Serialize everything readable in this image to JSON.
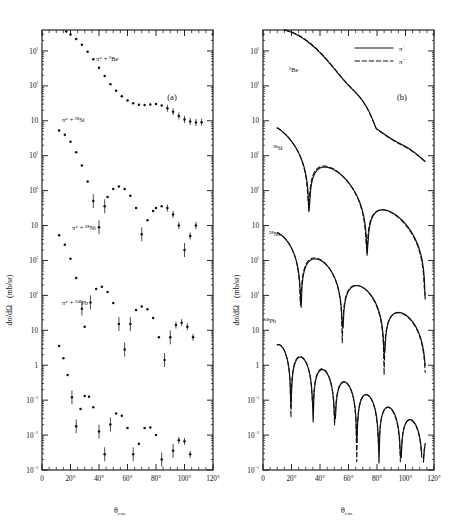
{
  "figure": {
    "caption_panel_a": "(a)",
    "caption_panel_b": "(b)",
    "yaxis_title_main": "dσ/dΩ",
    "yaxis_title_units": "(mb/sr)",
    "xaxis_title": "θ",
    "xaxis_title_sub": "c.m."
  },
  "axes": {
    "x_ticks": [
      "0",
      "20°",
      "40°",
      "60°",
      "80°",
      "100°",
      "120°"
    ],
    "x_values": [
      0,
      20,
      40,
      60,
      80,
      100,
      120
    ],
    "x_range": [
      0,
      120
    ],
    "y_decade_labels": [
      "10³",
      "10²",
      "10",
      "10³",
      "10²",
      "10",
      "10³",
      "10²",
      "10",
      "1",
      "10⁻¹",
      "10⁻²",
      "10⁻³"
    ],
    "y_decade_exponents": [
      11,
      10,
      9,
      8,
      7,
      6,
      5,
      4,
      3,
      2,
      1,
      0,
      -1
    ],
    "y_range_exponents": [
      -1,
      11.6
    ],
    "scale": "log"
  },
  "legend": {
    "position": "top-right-panel-b",
    "entries": [
      {
        "style": "solid",
        "label": "π",
        "charge": "+"
      },
      {
        "style": "dashed",
        "label": "π",
        "charge": "−"
      }
    ]
  },
  "targets": [
    {
      "id": "be",
      "mass": "9",
      "symbol": "Be",
      "label_a": "π⁺ + ⁹Be",
      "label_b": "⁹Be"
    },
    {
      "id": "si",
      "mass": "28",
      "symbol": "Si",
      "label_a": "π⁺ + ²⁸Si",
      "label_b": "²⁸Si"
    },
    {
      "id": "ni",
      "mass": "58",
      "symbol": "Ni",
      "label_a": "π⁺ + ⁵⁸Ni",
      "label_b": "⁵⁸Ni"
    },
    {
      "id": "pb",
      "mass": "208",
      "symbol": "Pb",
      "label_a": "π⁺ + ²⁰⁸Pb",
      "label_b": "²⁰⁸Pb"
    }
  ],
  "chart_data": {
    "type": "line",
    "title": "",
    "xlabel": "θ c.m.",
    "ylabel": "dσ/dΩ (mb/sr)",
    "xlim": [
      0,
      120
    ],
    "ylim_exponents": [
      -1,
      11.6
    ],
    "yscale": "log",
    "grid": false,
    "panels": [
      {
        "name": "(a)",
        "description": "measured differential cross sections, data points",
        "series": [
          {
            "name": "π⁺ + ⁹Be",
            "marker": "dot",
            "offset_decades": 9,
            "x": [
              14,
              17,
              20,
              24,
              28,
              32,
              36,
              40,
              44,
              48,
              52,
              56,
              60,
              64,
              68,
              72,
              76,
              80,
              84,
              88,
              92,
              96,
              100,
              104,
              108,
              112
            ],
            "log10_y": [
              2.62,
              2.56,
              2.47,
              2.34,
              2.18,
              1.98,
              1.76,
              1.52,
              1.28,
              1.05,
              0.86,
              0.7,
              0.58,
              0.5,
              0.46,
              0.45,
              0.47,
              0.48,
              0.44,
              0.36,
              0.26,
              0.14,
              0.04,
              -0.02,
              -0.05,
              -0.04
            ]
          },
          {
            "name": "π⁺ + ²⁸Si",
            "marker": "dot",
            "offset_decades": 6,
            "x": [
              12,
              16,
              20,
              24,
              28,
              32,
              36,
              40,
              44,
              46,
              50,
              54,
              58,
              62,
              66,
              70,
              74,
              78,
              80,
              84,
              88,
              92,
              96,
              100,
              104,
              108
            ],
            "log10_y": [
              2.72,
              2.6,
              2.4,
              2.1,
              1.72,
              1.26,
              0.7,
              -0.05,
              0.55,
              0.82,
              1.05,
              1.12,
              1.05,
              0.85,
              0.5,
              -0.25,
              0.15,
              0.42,
              0.5,
              0.55,
              0.5,
              0.32,
              0.0,
              -0.7,
              -0.3,
              0.0
            ]
          },
          {
            "name": "π⁺ + ⁵⁸Ni",
            "marker": "dot",
            "offset_decades": 3,
            "x": [
              12,
              16,
              20,
              24,
              28,
              30,
              34,
              38,
              42,
              46,
              50,
              54,
              58,
              62,
              66,
              70,
              74,
              78,
              82,
              86,
              90,
              94,
              98,
              102,
              106
            ],
            "log10_y": [
              2.72,
              2.45,
              2.05,
              1.5,
              0.62,
              0.1,
              0.8,
              1.18,
              1.25,
              1.1,
              0.78,
              0.18,
              -0.55,
              0.18,
              0.58,
              0.68,
              0.6,
              0.35,
              -0.2,
              -0.85,
              -0.2,
              0.15,
              0.22,
              0.1,
              -0.2
            ]
          },
          {
            "name": "π⁺ + ²⁰⁸Pb",
            "marker": "dot",
            "offset_decades": 0,
            "x": [
              12,
              15,
              18,
              21,
              24,
              27,
              30,
              33,
              36,
              40,
              44,
              48,
              52,
              56,
              60,
              64,
              68,
              72,
              76,
              80,
              84,
              88,
              92,
              96,
              100,
              104,
              108
            ],
            "log10_y": [
              2.55,
              2.2,
              1.72,
              1.08,
              0.25,
              0.75,
              1.12,
              1.1,
              0.8,
              0.1,
              -0.55,
              0.3,
              0.62,
              0.55,
              0.2,
              -0.55,
              -0.25,
              0.2,
              0.22,
              0.0,
              -0.7,
              -1.55,
              -0.45,
              -0.15,
              -0.18,
              -0.55,
              -1.25
            ]
          }
        ]
      },
      {
        "name": "(b)",
        "description": "optical model calculations; solid π⁺, dashed π⁻",
        "series": [
          {
            "name": "⁹Be π⁺",
            "style": "solid",
            "offset_decades": 9
          },
          {
            "name": "⁹Be π⁻",
            "style": "dashed",
            "offset_decades": 9
          },
          {
            "name": "²⁸Si π⁺",
            "style": "solid",
            "offset_decades": 6
          },
          {
            "name": "²⁸Si π⁻",
            "style": "dashed",
            "offset_decades": 6
          },
          {
            "name": "⁵⁸Ni π⁺",
            "style": "solid",
            "offset_decades": 3
          },
          {
            "name": "⁵⁸Ni π⁻",
            "style": "dashed",
            "offset_decades": 3
          },
          {
            "name": "²⁰⁸Pb π⁺",
            "style": "solid",
            "offset_decades": 0
          },
          {
            "name": "²⁰⁸Pb π⁻",
            "style": "dashed",
            "offset_decades": 0
          }
        ]
      }
    ]
  }
}
